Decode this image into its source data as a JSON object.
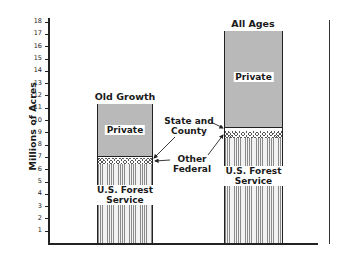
{
  "chart_data": {
    "type": "bar",
    "stacked": true,
    "title": "",
    "xlabel": "",
    "ylabel": "Millions of Acres",
    "ylim": [
      0,
      18
    ],
    "yticks": [
      1,
      2,
      3,
      4,
      5,
      6,
      7,
      8,
      9,
      10,
      11,
      12,
      13,
      14,
      15,
      16,
      17,
      18
    ],
    "categories": [
      "Old Growth",
      "All Ages"
    ],
    "series": [
      {
        "name": "U.S. Forest Service",
        "values": [
          6.4,
          8.5
        ]
      },
      {
        "name": "Other Federal",
        "values": [
          0.5,
          0.6
        ]
      },
      {
        "name": "State and County",
        "values": [
          0.1,
          0.25
        ]
      },
      {
        "name": "Private",
        "values": [
          4.3,
          7.85
        ]
      }
    ],
    "totals": [
      11.3,
      17.2
    ],
    "annotations": [
      "State and County",
      "Other Federal"
    ],
    "grid": false,
    "legend": "inline labels"
  },
  "labels": {
    "ylabel": "Millions of Acres",
    "bar1_title": "Old Growth",
    "bar2_title": "All Ages",
    "private": "Private",
    "usfs_line1": "U.S. Forest",
    "usfs_line2": "Service",
    "state_line1": "State and",
    "state_line2": "County",
    "other_line1": "Other",
    "other_line2": "Federal"
  },
  "ticks": [
    "1",
    "2",
    "3",
    "4",
    "5",
    "6",
    "7",
    "8",
    "9",
    "10",
    "11",
    "12",
    "13",
    "14",
    "15",
    "16",
    "17",
    "18"
  ]
}
